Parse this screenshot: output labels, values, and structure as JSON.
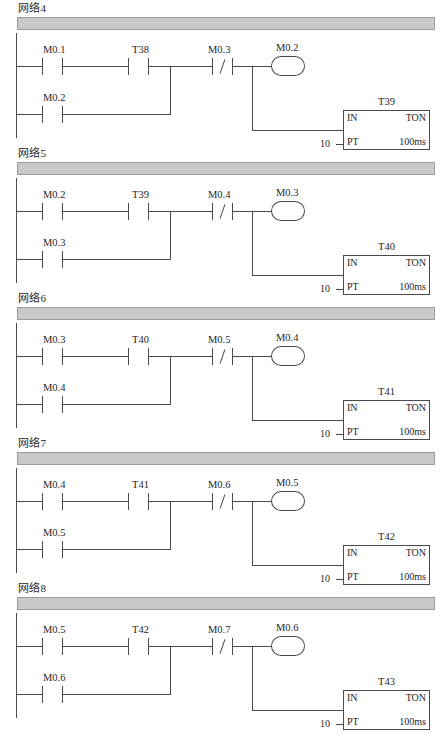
{
  "document": {
    "kind": "ladder-logic-diagram",
    "language": "S7-200 LAD",
    "network_count": 5
  },
  "labels": {
    "timer_in": "IN",
    "timer_type": "TON",
    "timer_pt": "PT",
    "timer_resolution": "100ms",
    "timer_preset": "10"
  },
  "networks": [
    {
      "title": "网络4",
      "contacts": [
        {
          "name": "M0.1",
          "type": "NO"
        },
        {
          "name": "T38",
          "type": "NO"
        },
        {
          "name": "M0.3",
          "type": "NC"
        }
      ],
      "coil": {
        "name": "M0.2"
      },
      "branch_contact": {
        "name": "M0.2",
        "type": "NO"
      },
      "timer": {
        "name": "T39",
        "in": "IN",
        "type": "TON",
        "pt": "PT",
        "preset": "10",
        "resolution": "100ms"
      }
    },
    {
      "title": "网络5",
      "contacts": [
        {
          "name": "M0.2",
          "type": "NO"
        },
        {
          "name": "T39",
          "type": "NO"
        },
        {
          "name": "M0.4",
          "type": "NC"
        }
      ],
      "coil": {
        "name": "M0.3"
      },
      "branch_contact": {
        "name": "M0.3",
        "type": "NO"
      },
      "timer": {
        "name": "T40",
        "in": "IN",
        "type": "TON",
        "pt": "PT",
        "preset": "10",
        "resolution": "100ms"
      }
    },
    {
      "title": "网络6",
      "contacts": [
        {
          "name": "M0.3",
          "type": "NO"
        },
        {
          "name": "T40",
          "type": "NO"
        },
        {
          "name": "M0.5",
          "type": "NC"
        }
      ],
      "coil": {
        "name": "M0.4"
      },
      "branch_contact": {
        "name": "M0.4",
        "type": "NO"
      },
      "timer": {
        "name": "T41",
        "in": "IN",
        "type": "TON",
        "pt": "PT",
        "preset": "10",
        "resolution": "100ms"
      }
    },
    {
      "title": "网络7",
      "contacts": [
        {
          "name": "M0.4",
          "type": "NO"
        },
        {
          "name": "T41",
          "type": "NO"
        },
        {
          "name": "M0.6",
          "type": "NC"
        }
      ],
      "coil": {
        "name": "M0.5"
      },
      "branch_contact": {
        "name": "M0.5",
        "type": "NO"
      },
      "timer": {
        "name": "T42",
        "in": "IN",
        "type": "TON",
        "pt": "PT",
        "preset": "10",
        "resolution": "100ms"
      }
    },
    {
      "title": "网络8",
      "contacts": [
        {
          "name": "M0.5",
          "type": "NO"
        },
        {
          "name": "T42",
          "type": "NO"
        },
        {
          "name": "M0.7",
          "type": "NC"
        }
      ],
      "coil": {
        "name": "M0.6"
      },
      "branch_contact": {
        "name": "M0.6",
        "type": "NO"
      },
      "timer": {
        "name": "T43",
        "in": "IN",
        "type": "TON",
        "pt": "PT",
        "preset": "10",
        "resolution": "100ms"
      }
    }
  ]
}
